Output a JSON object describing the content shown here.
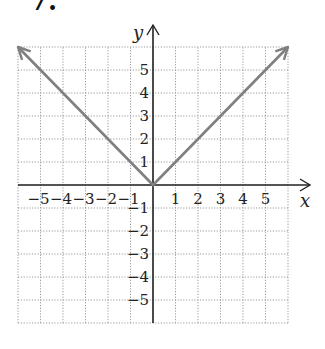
{
  "problem": {
    "number": "7."
  },
  "chart_data": {
    "type": "line",
    "title": "",
    "function": "y = |x|",
    "xlabel": "x",
    "ylabel": "y",
    "xlim": [
      -6,
      6
    ],
    "ylim": [
      -6,
      6
    ],
    "grid": true,
    "grid_style": "dotted",
    "x_ticks": [
      -5,
      -4,
      -3,
      -2,
      -1,
      1,
      2,
      3,
      4,
      5
    ],
    "y_ticks": [
      -5,
      -4,
      -3,
      -2,
      -1,
      1,
      2,
      3,
      4,
      5
    ],
    "x_tick_labels": [
      "−5",
      "−4",
      "−3",
      "−2",
      "−1",
      "1",
      "2",
      "3",
      "4",
      "5"
    ],
    "y_tick_labels": [
      "−5",
      "−4",
      "−3",
      "−2",
      "−1",
      "1",
      "2",
      "3",
      "4",
      "5"
    ],
    "series": [
      {
        "name": "y = |x|",
        "x": [
          -6,
          -5,
          -4,
          -3,
          -2,
          -1,
          0,
          1,
          2,
          3,
          4,
          5,
          6
        ],
        "y": [
          6,
          5,
          4,
          3,
          2,
          1,
          0,
          1,
          2,
          3,
          4,
          5,
          6
        ],
        "color": "#808080",
        "arrows_at_ends": true
      }
    ],
    "legend": null
  },
  "layout": {
    "origin_px": [
      153,
      185
    ],
    "unit_px_x": 22.5,
    "unit_px_y": 23,
    "colors": {
      "axis": "#222222",
      "grid": "#9a9a9a",
      "line": "#808080",
      "text": "#222222"
    }
  }
}
